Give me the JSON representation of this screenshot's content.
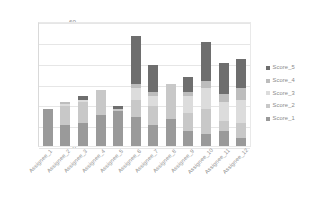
{
  "chart_data": {
    "type": "bar",
    "stacked": true,
    "title": "",
    "xlabel": "",
    "ylabel": "",
    "ylim": [
      0,
      60
    ],
    "yticks": [
      0,
      10,
      20,
      30,
      40,
      50,
      60
    ],
    "grid": true,
    "legend_position": "right",
    "categories": [
      "Assignee_1",
      "Assignee_2",
      "Assignee_3",
      "Assignee_4",
      "Assignee_5",
      "Assignee_6",
      "Assignee_7",
      "Assignee_8",
      "Assignee_9",
      "Assignee_10",
      "Assignee_11",
      "Assignee_12"
    ],
    "series": [
      {
        "name": "Score_1",
        "color": "#9a9a9a",
        "values": [
          18,
          10,
          11,
          15,
          17,
          14,
          10,
          13,
          7,
          6,
          7,
          4
        ]
      },
      {
        "name": "Score_2",
        "color": "#c8c8c8",
        "values": [
          0,
          9,
          10,
          12,
          1,
          8,
          9,
          17,
          9,
          12,
          5,
          7
        ]
      },
      {
        "name": "Score_3",
        "color": "#dcdcdc",
        "values": [
          0,
          1,
          1,
          0,
          0,
          6,
          5,
          0,
          8,
          10,
          9,
          11
        ]
      },
      {
        "name": "Score_4",
        "color": "#bdbdbd",
        "values": [
          0,
          1,
          0,
          0,
          0,
          2,
          2,
          0,
          2,
          3,
          4,
          6
        ]
      },
      {
        "name": "Score_5",
        "color": "#6e6e6e",
        "values": [
          0,
          0,
          2,
          0,
          1,
          23,
          13,
          0,
          7,
          19,
          15,
          14
        ]
      }
    ],
    "totals": [
      18,
      21,
      24,
      27,
      19,
      53,
      39,
      30,
      33,
      50,
      40,
      42
    ]
  },
  "legend": {
    "entries": [
      {
        "label": "Score_5",
        "color": "#6e6e6e"
      },
      {
        "label": "Score_4",
        "color": "#bdbdbd"
      },
      {
        "label": "Score_3",
        "color": "#dcdcdc"
      },
      {
        "label": "Score_2",
        "color": "#c8c8c8"
      },
      {
        "label": "Score_1",
        "color": "#9a9a9a"
      }
    ]
  }
}
